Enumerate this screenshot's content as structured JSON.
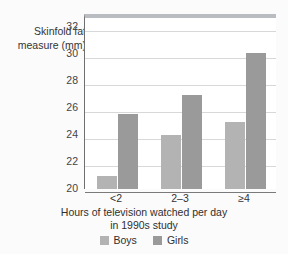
{
  "chart_data": {
    "type": "bar",
    "title": "",
    "categories": [
      "<2",
      "2–3",
      "≥4"
    ],
    "series": [
      {
        "name": "Boys",
        "values": [
          21.0,
          24.0,
          25.0
        ],
        "color": "#b3b3b3"
      },
      {
        "name": "Girls",
        "values": [
          25.6,
          27.0,
          30.1
        ],
        "color": "#9a9a9a"
      }
    ],
    "ylabel_line1": "Skinfold fat",
    "ylabel_line2": "measure (mm)",
    "xlabel_line1": "Hours of television watched per day",
    "xlabel_line2": "in 1990s study",
    "ylim": [
      20,
      33
    ],
    "yticks": [
      20,
      22,
      24,
      26,
      28,
      30,
      32
    ],
    "ytick_labels": [
      "20",
      "22",
      "24",
      "26",
      "28",
      "30",
      "32"
    ],
    "grid": true,
    "legend_position": "bottom"
  },
  "legend": {
    "items": [
      {
        "label": "Boys",
        "color": "#b3b3b3"
      },
      {
        "label": "Girls",
        "color": "#9a9a9a"
      }
    ]
  },
  "colors": {
    "boys": "#b3b3b3",
    "girls": "#9a9a9a",
    "gridline": "#d6d8da",
    "axis": "#6f6f6f",
    "frame_top": "#b9bcc0",
    "plot_background": "#ffffff",
    "page_background": "#fbfbfb"
  }
}
